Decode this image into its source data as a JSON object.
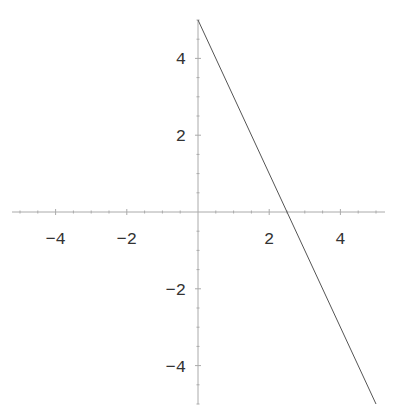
{
  "chart_data": {
    "type": "line",
    "title": "",
    "xlabel": "",
    "ylabel": "",
    "xlim": [
      -5.5,
      5.3
    ],
    "ylim": [
      -5.0,
      5.0
    ],
    "grid": false,
    "legend": null,
    "x_ticks": [
      -4,
      -2,
      2,
      4
    ],
    "y_ticks": [
      4,
      2,
      -2,
      -4
    ],
    "x_tick_labels": [
      "−4",
      "−2",
      "2",
      "4"
    ],
    "y_tick_labels": [
      "4",
      "2",
      "−2",
      "−4"
    ],
    "series": [
      {
        "name": "y = 5 - 2x",
        "x": [
          0,
          5
        ],
        "y": [
          5,
          -5
        ],
        "color": "#555555"
      }
    ]
  },
  "colors": {
    "axis": "#aaaaaa",
    "line": "#555555",
    "text": "#333333",
    "background": "#ffffff"
  }
}
